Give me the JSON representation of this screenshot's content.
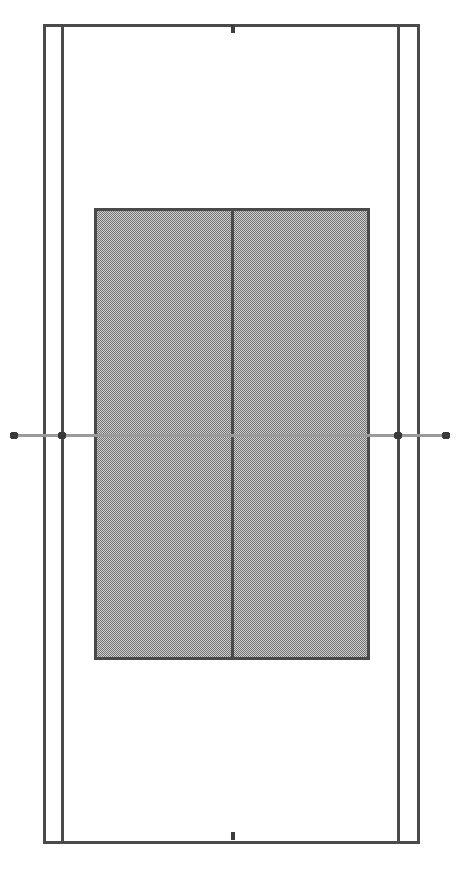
{
  "figure": {
    "name": "tennis-court-diagram",
    "width": 458,
    "height": 874,
    "orientation": "portrait",
    "background_color": "#ffffff"
  },
  "colors": {
    "line_color": "#4a4a4a",
    "line_color_dark": "#3d3d3d",
    "service_box_fill": "#c9c9c9",
    "service_box_pattern": "#707070",
    "net_line_color": "#9a9a9a",
    "net_marker_color": "#3a3a3a",
    "background": "#ffffff"
  },
  "chart_data": {
    "type": "diagram",
    "xlabel": "",
    "ylabel": "",
    "xlim": [
      0,
      458
    ],
    "ylim": [
      0,
      874
    ],
    "grid": false,
    "legend": "none",
    "elements": [
      {
        "id": "doubles-court-outline",
        "label": "Doubles court outline",
        "shape": "rectangle",
        "x1": 43,
        "y1": 24,
        "x2": 417,
        "y2": 841,
        "stroke_width": 3,
        "fill": "none"
      },
      {
        "id": "singles-sideline-left",
        "label": "Left singles sideline",
        "shape": "line",
        "x1": 62,
        "y1": 24,
        "x2": 62,
        "y2": 841,
        "stroke_width": 3
      },
      {
        "id": "singles-sideline-right",
        "label": "Right singles sideline",
        "shape": "line",
        "x1": 398,
        "y1": 24,
        "x2": 398,
        "y2": 841,
        "stroke_width": 3
      },
      {
        "id": "service-boxes-region",
        "label": "Shaded service boxes region",
        "shape": "rectangle",
        "x1": 94,
        "y1": 208,
        "x2": 367,
        "y2": 657,
        "stroke_width": 3,
        "fill": "pattern"
      },
      {
        "id": "service-line-top",
        "label": "Top service line",
        "shape": "line",
        "x1": 94,
        "y1": 208,
        "x2": 367,
        "y2": 208,
        "stroke_width": 3
      },
      {
        "id": "service-line-bottom",
        "label": "Bottom service line",
        "shape": "line",
        "x1": 94,
        "y1": 657,
        "x2": 367,
        "y2": 657,
        "stroke_width": 3
      },
      {
        "id": "center-service-line",
        "label": "Center service line",
        "shape": "line",
        "x1": 232,
        "y1": 208,
        "x2": 232,
        "y2": 657,
        "stroke_width": 3
      },
      {
        "id": "net-line",
        "label": "Net line",
        "shape": "line",
        "x1": 14,
        "y1": 435,
        "x2": 446,
        "y2": 435,
        "stroke_width": 2
      },
      {
        "id": "baseline-top",
        "label": "Top baseline",
        "shape": "line",
        "x1": 43,
        "y1": 24,
        "x2": 417,
        "y2": 24,
        "stroke_width": 3
      },
      {
        "id": "baseline-bottom",
        "label": "Bottom baseline",
        "shape": "line",
        "x1": 43,
        "y1": 841,
        "x2": 417,
        "y2": 841,
        "stroke_width": 3
      },
      {
        "id": "center-mark-top",
        "label": "Top baseline center mark",
        "shape": "line",
        "x1": 232,
        "y1": 24,
        "x2": 232,
        "y2": 34,
        "stroke_width": 4
      },
      {
        "id": "center-mark-bottom",
        "label": "Bottom baseline center mark",
        "shape": "line",
        "x1": 232,
        "y1": 831,
        "x2": 232,
        "y2": 841,
        "stroke_width": 4
      }
    ],
    "net_markers": [
      {
        "id": "net-post-outer-left",
        "label": "Outer left net post",
        "cx": 14,
        "cy": 435,
        "r": 4
      },
      {
        "id": "net-post-inner-left",
        "label": "Inner left net marker (singles post)",
        "cx": 62,
        "cy": 435,
        "r": 4
      },
      {
        "id": "net-post-inner-right",
        "label": "Inner right net marker (singles post)",
        "cx": 398,
        "cy": 435,
        "r": 4
      },
      {
        "id": "net-post-outer-right",
        "label": "Outer right net post",
        "cx": 446,
        "cy": 435,
        "r": 4
      }
    ],
    "regions": [
      {
        "id": "deuce-court-near",
        "label": "Near left service box"
      },
      {
        "id": "ad-court-near",
        "label": "Near right service box"
      },
      {
        "id": "deuce-court-far",
        "label": "Far left service box"
      },
      {
        "id": "ad-court-far",
        "label": "Far right service box"
      },
      {
        "id": "backcourt-top",
        "label": "Top backcourt"
      },
      {
        "id": "backcourt-bottom",
        "label": "Bottom backcourt"
      },
      {
        "id": "alley-left",
        "label": "Left doubles alley"
      },
      {
        "id": "alley-right",
        "label": "Right doubles alley"
      }
    ]
  }
}
